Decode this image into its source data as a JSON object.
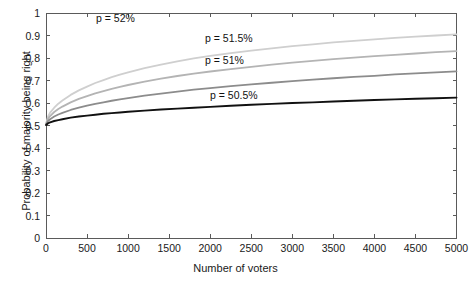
{
  "chart_data": {
    "type": "line",
    "title": "",
    "xlabel": "Number of voters",
    "ylabel": "Probability of majority being right",
    "xlim": [
      0,
      5000
    ],
    "ylim": [
      0,
      1
    ],
    "grid": false,
    "legend_position": "inline-annotations",
    "xticks": [
      0,
      500,
      1000,
      1500,
      2000,
      2500,
      3000,
      3500,
      4000,
      4500,
      5000
    ],
    "xtick_labels": [
      "0",
      "500",
      "1000",
      "1500",
      "2000",
      "2500",
      "3000",
      "3500",
      "4000",
      "4500",
      "5000"
    ],
    "yticks": [
      0,
      0.1,
      0.2,
      0.3,
      0.4,
      0.5,
      0.6,
      0.7,
      0.8,
      0.9,
      1
    ],
    "ytick_labels": [
      "0",
      "0.1",
      "0.2",
      "0.3",
      "0.4",
      "0.5",
      "0.6",
      "0.7",
      "0.8",
      "0.9",
      "1"
    ],
    "x": [
      1,
      25,
      50,
      100,
      150,
      200,
      300,
      400,
      500,
      600,
      700,
      800,
      900,
      1000,
      1200,
      1400,
      1600,
      1800,
      2000,
      2250,
      2500,
      2750,
      3000,
      3250,
      3500,
      3750,
      4000,
      4250,
      4500,
      4750,
      5000
    ],
    "series": [
      {
        "name": "p = 52%",
        "p": 0.52,
        "color": "#cfcfcf",
        "values": [
          0.508,
          0.54,
          0.557,
          0.579,
          0.597,
          0.611,
          0.636,
          0.656,
          0.673,
          0.689,
          0.702,
          0.715,
          0.726,
          0.736,
          0.755,
          0.771,
          0.785,
          0.798,
          0.809,
          0.822,
          0.833,
          0.843,
          0.853,
          0.861,
          0.869,
          0.876,
          0.883,
          0.889,
          0.895,
          0.9,
          0.905
        ]
      },
      {
        "name": "p = 51.5%",
        "p": 0.515,
        "color": "#b4b4b4",
        "values": [
          0.506,
          0.53,
          0.542,
          0.56,
          0.573,
          0.584,
          0.603,
          0.618,
          0.631,
          0.643,
          0.653,
          0.663,
          0.672,
          0.68,
          0.695,
          0.708,
          0.72,
          0.731,
          0.74,
          0.751,
          0.761,
          0.771,
          0.779,
          0.787,
          0.795,
          0.802,
          0.808,
          0.814,
          0.82,
          0.826,
          0.831
        ]
      },
      {
        "name": "p = 51%",
        "p": 0.51,
        "color": "#8c8c8c",
        "values": [
          0.504,
          0.52,
          0.528,
          0.54,
          0.549,
          0.556,
          0.569,
          0.579,
          0.588,
          0.596,
          0.603,
          0.61,
          0.616,
          0.622,
          0.633,
          0.642,
          0.651,
          0.659,
          0.666,
          0.675,
          0.683,
          0.69,
          0.697,
          0.704,
          0.71,
          0.716,
          0.721,
          0.727,
          0.732,
          0.736,
          0.741
        ]
      },
      {
        "name": "p = 50.5%",
        "p": 0.505,
        "color": "#111111",
        "values": [
          0.502,
          0.51,
          0.514,
          0.52,
          0.524,
          0.528,
          0.535,
          0.54,
          0.544,
          0.548,
          0.552,
          0.555,
          0.558,
          0.561,
          0.566,
          0.571,
          0.575,
          0.579,
          0.583,
          0.588,
          0.592,
          0.596,
          0.6,
          0.603,
          0.607,
          0.61,
          0.613,
          0.616,
          0.619,
          0.621,
          0.624
        ]
      }
    ],
    "annotations": [
      {
        "text": "p = 52%",
        "x_px": 96,
        "y_px": 12
      },
      {
        "text": "p = 51.5%",
        "x_px": 205,
        "y_px": 32
      },
      {
        "text": "p = 51%",
        "x_px": 205,
        "y_px": 54
      },
      {
        "text": "p = 50.5%",
        "x_px": 210,
        "y_px": 89
      }
    ],
    "axis_color": "#5a5a5a"
  }
}
